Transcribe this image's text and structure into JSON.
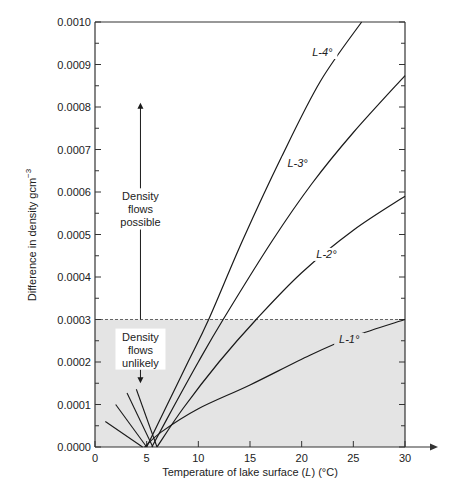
{
  "chart_data": {
    "type": "line",
    "title": "",
    "xlabel": "Temperature of lake surface (L) (°C)",
    "xlabel_parts": [
      "Temperature of lake surface (",
      "L",
      ") (°C)"
    ],
    "ylabel": "Difference in density gcm⁻³",
    "ylabel_parts": [
      "Difference in density gcm",
      "−3"
    ],
    "xlim": [
      0,
      30
    ],
    "ylim": [
      0,
      0.001
    ],
    "x_ticks": [
      0,
      5,
      10,
      15,
      20,
      25,
      30
    ],
    "x_tick_labels": [
      "0",
      "5",
      "10",
      "15",
      "20",
      "25",
      "30"
    ],
    "y_ticks": [
      0,
      0.0001,
      0.0002,
      0.0003,
      0.0004,
      0.0005,
      0.0006,
      0.0007,
      0.0008,
      0.0009,
      0.001
    ],
    "y_tick_labels": [
      "0.0000",
      "0.0001",
      "0.0002",
      "0.0003",
      "0.0004",
      "0.0005",
      "0.0006",
      "0.0007",
      "0.0008",
      "0.0009",
      "0.0010"
    ],
    "grid": false,
    "threshold": {
      "y": 0.0003,
      "style": "dashed",
      "shaded_below": true,
      "shade_color": "#e4e4e4"
    },
    "series": [
      {
        "name": "L-4°",
        "label_at": [
          22.0,
          0.00092
        ],
        "x": [
          5.0,
          7.0,
          9.0,
          11.0,
          14.3,
          18.0,
          21.8,
          25.8
        ],
        "y": [
          0.0,
          0.0001,
          0.0002,
          0.0003,
          0.000487,
          0.00068,
          0.00086,
          0.001
        ]
      },
      {
        "name": "L-3°",
        "label_at": [
          19.6,
          0.00066
        ],
        "x": [
          5.5,
          7.5,
          10.0,
          12.4,
          17.2,
          21.0,
          25.0,
          30.0
        ],
        "y": [
          0.0,
          9e-05,
          0.0002,
          0.0003,
          0.000487,
          0.00062,
          0.00074,
          0.000874
        ]
      },
      {
        "name": "L-2°",
        "label_at": [
          22.4,
          0.000445
        ],
        "x": [
          6.0,
          8.5,
          12.0,
          15.6,
          20.0,
          25.0,
          30.0
        ],
        "y": [
          0.0,
          9e-05,
          0.0002,
          0.0003,
          0.00041,
          0.00051,
          0.00059
        ]
      },
      {
        "name": "L-1°",
        "label_at": [
          24.6,
          0.000245
        ],
        "x": [
          4.8,
          6.4,
          10.0,
          15.0,
          20.8,
          25.0,
          30.0
        ],
        "y": [
          0.0,
          3.5e-05,
          9e-05,
          0.000146,
          0.000216,
          0.00026,
          0.0003
        ]
      }
    ],
    "fan_lines": [
      {
        "x": [
          1.0,
          4.6
        ],
        "y": [
          6e-05,
          0.0
        ]
      },
      {
        "x": [
          2.0,
          5.0
        ],
        "y": [
          0.0001,
          0.0
        ]
      },
      {
        "x": [
          3.1,
          5.6
        ],
        "y": [
          0.000127,
          0.0
        ]
      },
      {
        "x": [
          4.0,
          6.0
        ],
        "y": [
          0.000136,
          0.0
        ]
      }
    ],
    "annotations": [
      {
        "text_lines": [
          "Density",
          "flows",
          "possible"
        ],
        "x": 4.4,
        "y": 0.000555,
        "arrow": "up",
        "arrow_to": 0.00081
      },
      {
        "text_lines": [
          "Density",
          "flows",
          "unlikely"
        ],
        "x": 4.4,
        "y": 0.000225,
        "arrow": "down",
        "arrow_to": 0.00015
      }
    ],
    "colors": {
      "line": "#1a1a1a",
      "shade": "#e4e4e4",
      "axis": "#333333"
    }
  }
}
